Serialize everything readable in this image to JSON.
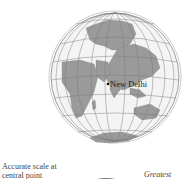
{
  "figure": {
    "projection": "Orthographic / perspective azimuthal globe",
    "center_city": "New Delhi",
    "colors": {
      "land": "#9a9a9a",
      "ocean": "#f2f2f2",
      "graticule": "#777777",
      "outline": "#888888"
    }
  },
  "labels": {
    "city": "New Delhi",
    "caption_left_line1": "Accurate scale at",
    "caption_left_line2": "central point",
    "caption_right": "Greatest"
  }
}
